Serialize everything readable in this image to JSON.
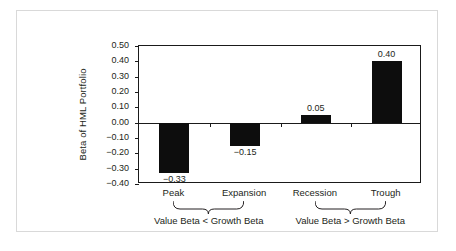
{
  "chart_data": {
    "type": "bar",
    "title": "",
    "xlabel": "",
    "ylabel": "Beta of HML Portfolio",
    "categories": [
      "Peak",
      "Expansion",
      "Recession",
      "Trough"
    ],
    "values": [
      -0.33,
      -0.15,
      0.05,
      0.4
    ],
    "value_labels": [
      "−0.33",
      "−0.15",
      "0.05",
      "0.40"
    ],
    "ylim": [
      -0.4,
      0.5
    ],
    "ytick_values": [
      0.5,
      0.4,
      0.3,
      0.2,
      0.1,
      0.0,
      -0.1,
      -0.2,
      -0.3,
      -0.4
    ],
    "ytick_labels": [
      "0.50",
      "0.40",
      "0.30",
      "0.20",
      "0.10",
      "0.00",
      "−0.10",
      "−0.20",
      "−0.30",
      "−0.40"
    ],
    "grid": false,
    "legend": false,
    "bar_color": "#0d0d0d",
    "axis_color": "#1a1a1a",
    "annotations": [
      {
        "label": "Value Beta < Growth Beta",
        "covers": [
          "Peak",
          "Expansion"
        ]
      },
      {
        "label": "Value Beta > Growth Beta",
        "covers": [
          "Recession",
          "Trough"
        ]
      }
    ]
  },
  "figure": {
    "background_color": "#ffffff",
    "border_color": "#d9d9d9"
  }
}
